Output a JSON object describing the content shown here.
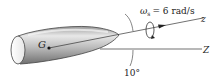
{
  "diagram": {
    "body_point_label": "G",
    "spin": {
      "symbol": "ω",
      "subscript": "s",
      "equals": "= 6 rad/s",
      "value": 6,
      "unit": "rad/s"
    },
    "axes": {
      "body_axis_label": "z",
      "fixed_axis_label": "Z"
    },
    "angle_label": "10°",
    "angle_value_deg": 10,
    "colors": {
      "body_light": "#f2f2f2",
      "body_mid": "#b8b8b8",
      "body_dark": "#6e6e6e",
      "line": "#333333"
    }
  }
}
